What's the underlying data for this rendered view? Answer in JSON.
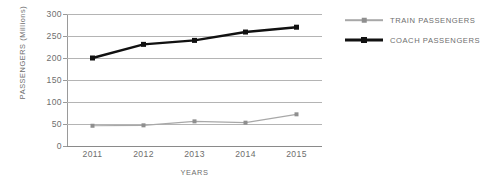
{
  "chart_data": {
    "type": "line",
    "title": "",
    "xlabel": "YEARS",
    "ylabel": "PASSENGERS (Millions)",
    "categories": [
      "2011",
      "2012",
      "2013",
      "2014",
      "2015"
    ],
    "ylim": [
      0,
      300
    ],
    "yticks": [
      0,
      50,
      100,
      150,
      200,
      250,
      300
    ],
    "ytick_labels": [
      "0",
      "50",
      "100",
      "150",
      "200",
      "250",
      "300"
    ],
    "grid": true,
    "legend_position": "right",
    "series": [
      {
        "name": "TRAIN PASSENGERS",
        "color": "#a8a8a8",
        "marker_color": "#8f8f8f",
        "values": [
          46,
          47,
          56,
          53,
          72
        ]
      },
      {
        "name": "COACH PASSENGERS",
        "color": "#111111",
        "marker_color": "#111111",
        "values": [
          200,
          231,
          240,
          259,
          270
        ]
      }
    ]
  },
  "axes": {
    "y_title": "PASSENGERS (Millions)",
    "x_title": "YEARS"
  },
  "legend": {
    "items": [
      {
        "label": "TRAIN PASSENGERS"
      },
      {
        "label": "COACH PASSENGERS"
      }
    ]
  },
  "colors": {
    "train": "#a8a8a8",
    "coach": "#111111",
    "grid": "#b4b4b4",
    "axis": "#9a9a9a",
    "text": "#6e6e6e",
    "background": "#ffffff"
  }
}
